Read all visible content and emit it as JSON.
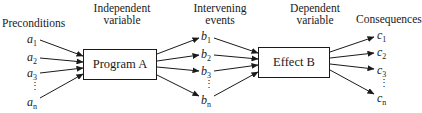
{
  "diagram": {
    "stages": [
      {
        "id": "preconditions",
        "title_lines": [
          "Preconditions"
        ]
      },
      {
        "id": "independent",
        "title_lines": [
          "Independent",
          "variable"
        ]
      },
      {
        "id": "intervening",
        "title_lines": [
          "Intervening",
          "events"
        ]
      },
      {
        "id": "dependent",
        "title_lines": [
          "Dependent",
          "variable"
        ]
      },
      {
        "id": "consequences",
        "title_lines": [
          "Consequences"
        ]
      }
    ],
    "boxes": {
      "program": "Program A",
      "effect": "Effect B"
    },
    "preconditions": [
      {
        "sym": "a",
        "sub": "1"
      },
      {
        "sym": "a",
        "sub": "2"
      },
      {
        "sym": "a",
        "sub": "3"
      },
      {
        "sym": "a",
        "sub": "n"
      }
    ],
    "intervening": [
      {
        "sym": "b",
        "sub": "1"
      },
      {
        "sym": "b",
        "sub": "2"
      },
      {
        "sym": "b",
        "sub": "3"
      },
      {
        "sym": "b",
        "sub": "n"
      }
    ],
    "consequences": [
      {
        "sym": "c",
        "sub": "1"
      },
      {
        "sym": "c",
        "sub": "2"
      },
      {
        "sym": "c",
        "sub": "3"
      },
      {
        "sym": "c",
        "sub": "n"
      }
    ],
    "ellipsis": "⋮",
    "line_color": "#1a1a1a"
  }
}
